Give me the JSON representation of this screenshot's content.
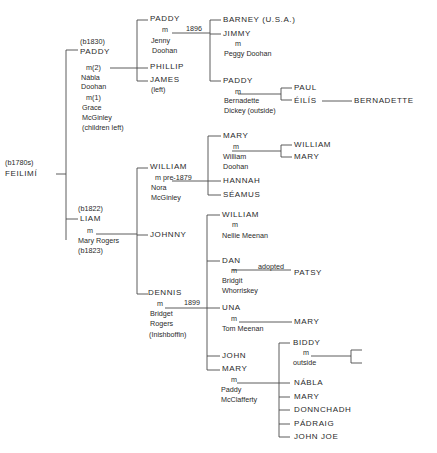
{
  "diagram": {
    "type": "family-tree",
    "root": {
      "born": "(b1780s)",
      "name": "FEILIMÍ"
    },
    "generation2": [
      {
        "id": "paddy-b1830",
        "born": "(b1830)",
        "name": "PADDY",
        "marriages": [
          {
            "label": "m(2)",
            "spouse_line1": "Nábla",
            "spouse_line2": "Doohan"
          },
          {
            "label": "m(1)",
            "spouse_line1": "Grace",
            "spouse_line2": "McGinley",
            "note": "(children left)"
          }
        ],
        "children": [
          {
            "name": "PADDY",
            "marriage_label": "m",
            "marriage_year": "1896",
            "spouse_line1": "Jenny",
            "spouse_line2": "Doohan",
            "children": [
              {
                "name": "BARNEY (U.S.A.)"
              },
              {
                "name": "JIMMY",
                "marriage_label": "m",
                "spouse": "Peggy Doohan"
              },
              {
                "name": "PADDY",
                "marriage_label": "m",
                "spouse_line1": "Bernadette",
                "spouse_line2": "Dickey (outside)",
                "children": [
                  {
                    "name": "PAUL"
                  },
                  {
                    "name": "ÉILÍS",
                    "children": [
                      {
                        "name": "BERNADETTE"
                      }
                    ]
                  }
                ]
              }
            ]
          },
          {
            "name": "PHILLIP"
          },
          {
            "name": "JAMES",
            "note": "(left)"
          }
        ]
      },
      {
        "id": "liam-b1822",
        "born": "(b1822)",
        "name": "LIAM",
        "marriage_label": "m",
        "spouse": "Mary Rogers",
        "spouse_born": "(b1823)",
        "children": [
          {
            "name": "WILLIAM",
            "marriage_label": "m pre-1879",
            "spouse_line1": "Nora",
            "spouse_line2": "McGinley",
            "children": [
              {
                "name": "MARY",
                "marriage_label": "m",
                "spouse_line1": "William",
                "spouse_line2": "Doohan",
                "children": [
                  {
                    "name": "WILLIAM"
                  },
                  {
                    "name": "MARY"
                  }
                ]
              },
              {
                "name": "HANNAH"
              },
              {
                "name": "SÉAMUS"
              }
            ]
          },
          {
            "name": "JOHNNY"
          },
          {
            "name": "DENNIS",
            "marriage_label": "m",
            "marriage_year": "1899",
            "spouse_line1": "Bridget",
            "spouse_line2": "Rogers",
            "spouse_note": "(Inishboffin)",
            "children": [
              {
                "name": "WILLIAM",
                "marriage_label": "m",
                "spouse": "Nellie Meenan"
              },
              {
                "name": "DAN",
                "marriage_label": "m",
                "spouse_line1": "Bridgit",
                "spouse_line2": "Whorriskey",
                "adopted_label": "adopted",
                "adopted_child": "PATSY"
              },
              {
                "name": "UNA",
                "marriage_label": "m",
                "spouse": "Tom Meenan",
                "children": [
                  {
                    "name": "MARY"
                  }
                ]
              },
              {
                "name": "JOHN"
              },
              {
                "name": "MARY",
                "marriage_label": "m",
                "spouse_line1": "Paddy",
                "spouse_line2": "McClafferty",
                "children": [
                  {
                    "name": "BIDDY",
                    "marriage_label": "m",
                    "spouse": "outside",
                    "children_unnamed": 2
                  },
                  {
                    "name": "NÁBLA"
                  },
                  {
                    "name": "MARY"
                  },
                  {
                    "name": "DONNCHADH"
                  },
                  {
                    "name": "PÁDRAIG"
                  },
                  {
                    "name": "JOHN JOE"
                  }
                ]
              }
            ]
          }
        ]
      }
    ]
  },
  "colors": {
    "ink": "#2a2a2a",
    "lines": "#4a4a4a",
    "background": "#ffffff"
  }
}
